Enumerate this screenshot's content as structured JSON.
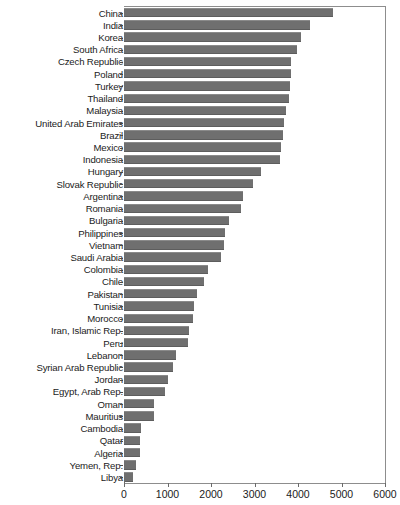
{
  "chart_data": {
    "type": "bar",
    "orientation": "horizontal",
    "title": "",
    "subtitle": "",
    "xlabel": "",
    "ylabel": "",
    "xlim": [
      0,
      6000
    ],
    "xticks": [
      0,
      1000,
      2000,
      3000,
      4000,
      5000,
      6000
    ],
    "xtick_labels": [
      "0",
      "1000",
      "2000",
      "3000",
      "4000",
      "5000",
      "6000"
    ],
    "grid": false,
    "legend": null,
    "bar_color": "#6f6f6f",
    "categories": [
      "China",
      "India",
      "Korea",
      "South Africa",
      "Czech Republic",
      "Poland",
      "Turkey",
      "Thailand",
      "Malaysia",
      "United Arab Emirates",
      "Brazil",
      "Mexico",
      "Indonesia",
      "Hungary",
      "Slovak Republic",
      "Argentina",
      "Romania",
      "Bulgaria",
      "Philippines",
      "Vietnam",
      "Saudi Arabia",
      "Colombia",
      "Chile",
      "Pakistan",
      "Tunisia",
      "Morocco",
      "Iran, Islamic Rep.",
      "Peru",
      "Lebanon",
      "Syrian Arab Republic",
      "Jordan",
      "Egypt, Arab Rep.",
      "Oman",
      "Mauritius",
      "Cambodia",
      "Qatar",
      "Algeria",
      "Yemen, Rep.",
      "Libya"
    ],
    "values": [
      4810,
      4280,
      4080,
      3980,
      3840,
      3830,
      3810,
      3790,
      3730,
      3680,
      3660,
      3620,
      3590,
      3150,
      2960,
      2740,
      2700,
      2420,
      2330,
      2300,
      2230,
      1940,
      1830,
      1680,
      1620,
      1580,
      1490,
      1470,
      1200,
      1120,
      1000,
      940,
      700,
      680,
      400,
      370,
      370,
      280,
      210
    ]
  }
}
